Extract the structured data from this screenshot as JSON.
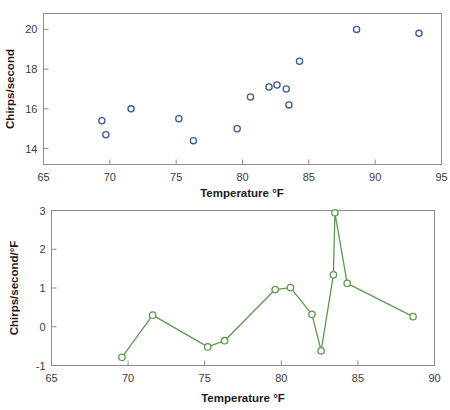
{
  "figure": {
    "background": "#ffffff",
    "panels": [
      "scatter-panel",
      "derivative-panel"
    ]
  },
  "colors": {
    "scatter_marker": "#3c5a96",
    "line_series": "#5d9a4e",
    "axis": "#8c8c8c",
    "text": "#1a1a1a"
  },
  "chart_data": [
    {
      "id": "scatter-panel",
      "type": "scatter",
      "title": "",
      "xlabel": "Temperature °F",
      "ylabel": "Chirps/second",
      "xlim": [
        65,
        95
      ],
      "ylim": [
        13.2,
        20.8
      ],
      "xticks": [
        65,
        70,
        75,
        80,
        85,
        90,
        95
      ],
      "xticklabels": [
        "65",
        "70",
        "75",
        "80",
        "85",
        "90",
        "95"
      ],
      "yticks": [
        14,
        16,
        18,
        20
      ],
      "yticklabels": [
        "14",
        "16",
        "18",
        "20"
      ],
      "grid": false,
      "legend": null,
      "marker": "open-circle",
      "x": [
        69.4,
        69.7,
        71.6,
        75.2,
        76.3,
        79.6,
        80.6,
        82.0,
        82.6,
        83.3,
        83.5,
        84.3,
        88.6,
        93.3
      ],
      "y": [
        15.4,
        14.7,
        16.0,
        15.5,
        14.4,
        15.0,
        16.6,
        17.1,
        17.2,
        17.0,
        16.2,
        18.4,
        20.0,
        19.8
      ]
    },
    {
      "id": "derivative-panel",
      "type": "line",
      "title": "",
      "xlabel": "Temperature °F",
      "ylabel": "Chirps/second/°F",
      "xlim": [
        65,
        90
      ],
      "ylim": [
        -1,
        3
      ],
      "xticks": [
        65,
        70,
        75,
        80,
        85,
        90
      ],
      "xticklabels": [
        "65",
        "70",
        "75",
        "80",
        "85",
        "90"
      ],
      "yticks": [
        -1,
        0,
        1,
        2,
        3
      ],
      "yticklabels": [
        "-1",
        "0",
        "1",
        "2",
        "3"
      ],
      "grid": false,
      "legend": null,
      "marker": "open-circle",
      "x": [
        69.6,
        71.6,
        75.2,
        76.3,
        79.6,
        80.6,
        82.0,
        82.6,
        83.4,
        83.5,
        84.3,
        88.6
      ],
      "y": [
        -0.79,
        0.3,
        -0.52,
        -0.36,
        0.96,
        1.01,
        0.32,
        -0.62,
        1.34,
        2.94,
        1.12,
        0.26
      ]
    }
  ]
}
